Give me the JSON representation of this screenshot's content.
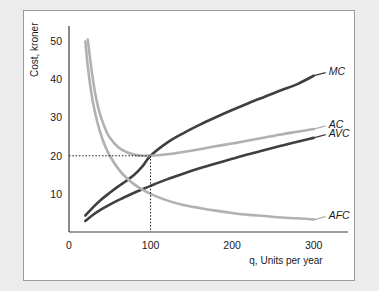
{
  "figure": {
    "background_color": "#ececed",
    "panel_color": "#ffffff",
    "border_color": "#9a9a9a"
  },
  "chart_data": {
    "type": "line",
    "title": "",
    "subtitle": "",
    "xlabel": "q, Units per year",
    "ylabel": "Cost, kroner",
    "xlim": [
      0,
      320
    ],
    "ylim": [
      0,
      53
    ],
    "xticks": [
      0,
      100,
      200,
      300
    ],
    "yticks": [
      10,
      20,
      30,
      40,
      50
    ],
    "xtick_labels": [
      "0",
      "100",
      "200",
      "300"
    ],
    "ytick_labels": [
      "10",
      "20",
      "30",
      "40",
      "50"
    ],
    "grid": false,
    "legend_position": "right-inline-labels",
    "annotations": [
      {
        "name": "minimum-average-cost",
        "text": "",
        "x": 100,
        "y": 20,
        "style": "dotted-guides"
      }
    ],
    "series": [
      {
        "name": "MC",
        "label": "MC",
        "color": "#3f3f42",
        "width": 2.6,
        "label_x": 300,
        "label_y": 41,
        "x": [
          20,
          30,
          40,
          50,
          60,
          70,
          80,
          90,
          100,
          120,
          140,
          160,
          180,
          200,
          220,
          240,
          260,
          280,
          300
        ],
        "y": [
          4.3,
          6.6,
          8.6,
          10.3,
          11.9,
          13.4,
          15.0,
          17.2,
          20.0,
          23.4,
          25.9,
          28.1,
          30.1,
          32.0,
          33.8,
          35.5,
          37.2,
          38.8,
          41.0
        ]
      },
      {
        "name": "AC",
        "label": "AC",
        "color": "#b0b1b4",
        "width": 2.6,
        "label_x": 300,
        "label_y": 27,
        "x": [
          23,
          25,
          28,
          32,
          36,
          40,
          45,
          50,
          60,
          70,
          80,
          90,
          100,
          120,
          140,
          160,
          180,
          200,
          220,
          240,
          260,
          280,
          300
        ],
        "y": [
          50.5,
          47.0,
          42.0,
          36.5,
          32.5,
          29.6,
          26.8,
          24.8,
          22.3,
          21.0,
          20.3,
          20.0,
          20.0,
          20.4,
          21.0,
          21.7,
          22.5,
          23.2,
          24.0,
          24.8,
          25.6,
          26.3,
          27.0
        ]
      },
      {
        "name": "AVC",
        "label": "AVC",
        "color": "#3f3f42",
        "width": 2.6,
        "label_x": 300,
        "label_y": 24.7,
        "x": [
          20,
          30,
          40,
          50,
          60,
          70,
          80,
          90,
          100,
          120,
          140,
          160,
          180,
          200,
          220,
          240,
          260,
          280,
          300
        ],
        "y": [
          2.9,
          4.6,
          6.0,
          7.2,
          8.3,
          9.3,
          10.3,
          11.2,
          12.1,
          13.8,
          15.3,
          16.7,
          18.0,
          19.2,
          20.4,
          21.5,
          22.6,
          23.7,
          24.7
        ]
      },
      {
        "name": "AFC",
        "label": "AFC",
        "color": "#b0b1b4",
        "width": 2.6,
        "label_x": 300,
        "label_y": 3.2,
        "x": [
          20,
          23,
          26,
          30,
          35,
          40,
          45,
          50,
          60,
          70,
          80,
          90,
          100,
          120,
          140,
          160,
          180,
          200,
          220,
          240,
          260,
          280,
          300
        ],
        "y": [
          50.0,
          43.5,
          38.5,
          33.3,
          28.6,
          25.0,
          22.2,
          20.0,
          16.7,
          14.3,
          12.5,
          11.1,
          10.0,
          8.3,
          7.1,
          6.3,
          5.6,
          5.0,
          4.5,
          4.2,
          3.8,
          3.6,
          3.3
        ]
      }
    ]
  }
}
